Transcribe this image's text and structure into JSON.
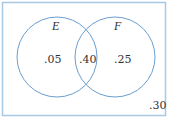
{
  "diagram": {
    "type": "venn",
    "colors": {
      "stroke": "#6a9ecf",
      "frame": "#a8c8e4",
      "text": "#333333"
    },
    "sets": [
      {
        "name": "E",
        "only_value": ".05"
      },
      {
        "name": "F",
        "only_value": ".25"
      }
    ],
    "intersection_value": ".40",
    "outside_value": ".30"
  }
}
